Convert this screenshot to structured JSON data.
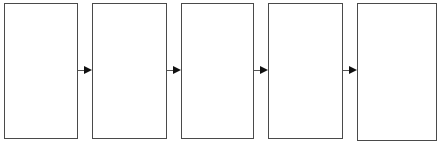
{
  "diagram": {
    "type": "flow",
    "direction": "left-to-right",
    "colors": {
      "border": "#4a4a4a",
      "arrow": "#111111",
      "background": "#ffffff"
    },
    "boxes": [
      {
        "id": "box-1",
        "label": "",
        "x": 4,
        "y": 3,
        "w": 74,
        "h": 136
      },
      {
        "id": "box-2",
        "label": "",
        "x": 92,
        "y": 3,
        "w": 75,
        "h": 136
      },
      {
        "id": "box-3",
        "label": "",
        "x": 181,
        "y": 3,
        "w": 73,
        "h": 136
      },
      {
        "id": "box-4",
        "label": "",
        "x": 268,
        "y": 3,
        "w": 75,
        "h": 136
      },
      {
        "id": "box-5",
        "label": "",
        "x": 357,
        "y": 3,
        "w": 80,
        "h": 138
      }
    ],
    "arrows": [
      {
        "from": "box-1",
        "to": "box-2",
        "x": 78,
        "y": 70,
        "w": 14
      },
      {
        "from": "box-2",
        "to": "box-3",
        "x": 167,
        "y": 70,
        "w": 14
      },
      {
        "from": "box-3",
        "to": "box-4",
        "x": 254,
        "y": 70,
        "w": 14
      },
      {
        "from": "box-4",
        "to": "box-5",
        "x": 343,
        "y": 70,
        "w": 14
      }
    ]
  }
}
